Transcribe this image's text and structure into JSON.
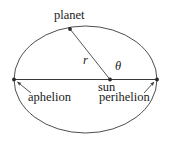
{
  "diagram": {
    "background_color": "#ffffff",
    "stroke_color": "#3a3a3a",
    "text_color": "#1a1a1a",
    "labels": {
      "planet": "planet",
      "sun": "sun",
      "aphelion": "aphelion",
      "perihelion": "perihelion",
      "radius": "r",
      "angle": "θ"
    },
    "geometry": {
      "ellipse": {
        "cx": 85.5,
        "cy": 79.5,
        "rx": 71.5,
        "ry": 53.5
      },
      "major_axis": {
        "x1": 14,
        "y1": 79.5,
        "x2": 157,
        "y2": 79.5
      },
      "sun_point": {
        "x": 110,
        "y": 79.5
      },
      "planet_point": {
        "x": 70,
        "y": 29
      },
      "aphelion_point": {
        "x": 14,
        "y": 79.5
      },
      "perihelion_point": {
        "x": 157,
        "y": 79.5
      },
      "radius_line": {
        "x1": 110,
        "y1": 79.5,
        "x2": 70,
        "y2": 29
      },
      "aphelion_pointer": {
        "x1": 31,
        "y1": 93,
        "x2": 16.5,
        "y2": 81.5
      },
      "perihelion_pointer": {
        "x1": 144,
        "y1": 93,
        "x2": 155,
        "y2": 81.5
      }
    }
  }
}
